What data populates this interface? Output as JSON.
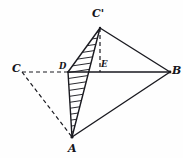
{
  "figure": {
    "type": "geometric-line-diagram",
    "canvas": {
      "width": 183,
      "height": 158
    },
    "background_color": "#fefefe",
    "stroke_color": "#1a1a20",
    "hatch_color": "#2a2a30",
    "solid_stroke_width": 1.4,
    "dashed_stroke_width": 1.2,
    "dash_pattern": "4,3",
    "points": [
      {
        "name": "A",
        "label": "A",
        "x": 72,
        "y": 137,
        "label_x": 68,
        "label_y": 143
      },
      {
        "name": "B",
        "label": "B",
        "x": 170,
        "y": 72,
        "label_x": 172,
        "label_y": 65
      },
      {
        "name": "C",
        "label": "C",
        "x": 22,
        "y": 72,
        "label_x": 12,
        "label_y": 63
      },
      {
        "name": "Cp",
        "label": "C'",
        "x": 100,
        "y": 28,
        "label_x": 92,
        "label_y": 8
      },
      {
        "name": "D",
        "label": "D",
        "x": 68,
        "y": 72,
        "label_x": 59,
        "label_y": 62
      },
      {
        "name": "E",
        "label": "E",
        "x": 100,
        "y": 72,
        "label_x": 101,
        "label_y": 60
      }
    ],
    "solid_edges": [
      {
        "name": "edge-Cp-A",
        "from": "Cp",
        "to": "A"
      },
      {
        "name": "edge-Cp-B",
        "from": "Cp",
        "to": "B"
      },
      {
        "name": "edge-A-B",
        "from": "A",
        "to": "B"
      },
      {
        "name": "edge-D-B",
        "from": "D",
        "to": "B"
      },
      {
        "name": "edge-A-D",
        "from": "A",
        "to": "D"
      },
      {
        "name": "edge-D-Cp",
        "from": "D",
        "to": "Cp"
      }
    ],
    "dashed_edges": [
      {
        "name": "edge-C-D",
        "from": "C",
        "to": "D"
      },
      {
        "name": "edge-C-A",
        "from": "C",
        "to": "A"
      },
      {
        "name": "edge-Cp-E",
        "from": "Cp",
        "to": "E"
      }
    ],
    "hatched_region": {
      "name": "section-ADCp",
      "vertices": [
        "A",
        "D",
        "Cp"
      ],
      "hatch_spacing": 6,
      "description": "cross-section triangle A-D-C' filled with parallel hatch lines"
    }
  }
}
